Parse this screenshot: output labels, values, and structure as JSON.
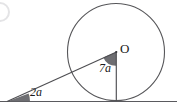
{
  "figure": {
    "kind": "circle-tangent-triangle-diagram",
    "width": 177,
    "height": 108,
    "background_color": "#ffffff",
    "stroke_color": "#545458",
    "wedge_fill_color": "#6e6e72",
    "text_color": "#1a1a1a",
    "labels": {
      "center_point": "O",
      "angle_at_center": "7a",
      "angle_at_vertex": "2a"
    },
    "geometry": {
      "baseline": {
        "y": 101,
        "x_start": 0,
        "x_end": 177
      },
      "circle": {
        "cx": 116,
        "cy": 52,
        "r": 48.5
      },
      "tangent_point": {
        "x": 116,
        "y": 100.5
      },
      "vertex": {
        "x": 8,
        "y": 101
      },
      "radius_line": {
        "from": "O",
        "to": "tangent_point"
      },
      "slant_line": {
        "from": "vertex",
        "to": "O"
      },
      "wedge_at_center_radius": 13,
      "wedge_at_vertex_radius": 22
    },
    "artifact": {
      "name": "page-edge-arc",
      "cx": 0,
      "cy": 12,
      "r": 9,
      "color": "#e2e2e4"
    }
  }
}
